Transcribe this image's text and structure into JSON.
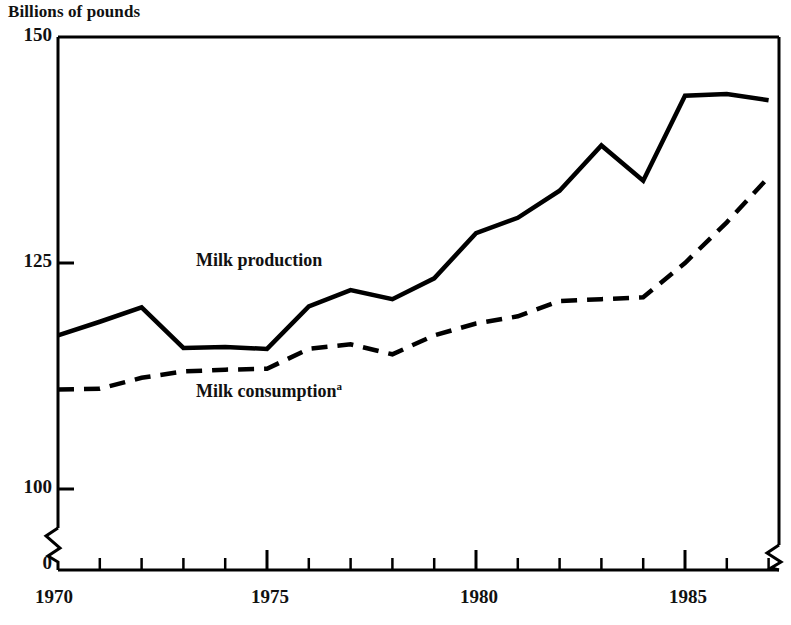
{
  "axis_title": "Billions of pounds",
  "y_ticks": [
    {
      "label": "150",
      "value": 150
    },
    {
      "label": "125",
      "value": 125
    },
    {
      "label": "100",
      "value": 100
    },
    {
      "label": "0",
      "value": 0
    }
  ],
  "x_ticks": [
    {
      "label": "1970",
      "value": 1970
    },
    {
      "label": "1975",
      "value": 1975
    },
    {
      "label": "1980",
      "value": 1980
    },
    {
      "label": "1985",
      "value": 1985
    }
  ],
  "labels": {
    "production": "Milk production",
    "consumption": "Milk consumption",
    "consumption_footnote": "a"
  },
  "chart_data": {
    "type": "line",
    "title": "",
    "subtitle": "",
    "xlabel": "",
    "ylabel": "Billions of pounds",
    "ylim": [
      95,
      150
    ],
    "xlim": [
      1970,
      1987
    ],
    "y_axis_break": true,
    "x_axis_break_left": true,
    "x_axis_break_right": true,
    "grid": false,
    "legend_position": "inline-annotation",
    "x": [
      1970,
      1971,
      1972,
      1973,
      1974,
      1975,
      1976,
      1977,
      1978,
      1979,
      1980,
      1981,
      1982,
      1983,
      1984,
      1985,
      1986,
      1987
    ],
    "series": [
      {
        "name": "Milk production",
        "style": "solid",
        "color": "#000000",
        "values": [
          117.0,
          118.5,
          120.1,
          115.6,
          115.7,
          115.5,
          120.2,
          122.0,
          121.0,
          123.3,
          128.3,
          130.0,
          133.0,
          138.0,
          134.1,
          143.5,
          143.7,
          143.0
        ]
      },
      {
        "name": "Milk consumption",
        "style": "dashed",
        "color": "#000000",
        "values": [
          111.0,
          111.1,
          112.3,
          113.0,
          113.2,
          113.3,
          115.5,
          116.0,
          114.9,
          117.0,
          118.3,
          119.1,
          120.8,
          121.0,
          121.2,
          125.0,
          129.5,
          134.5
        ]
      }
    ]
  },
  "colors": {
    "ink": "#000000",
    "background": "#ffffff"
  }
}
